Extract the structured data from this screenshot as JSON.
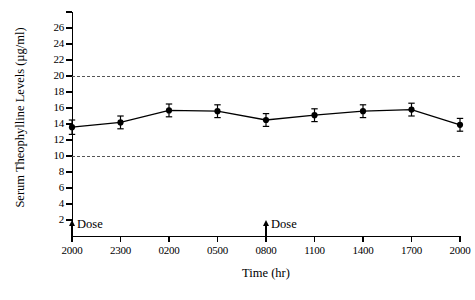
{
  "chart_data": {
    "type": "line",
    "title": "",
    "subtitle": "",
    "xlabel": "Time (hr)",
    "ylabel": "Serum Theophylline Levels (µg/ml)",
    "categories": [
      "2000",
      "2300",
      "0200",
      "0500",
      "0800",
      "1100",
      "1400",
      "1700",
      "2000"
    ],
    "values": [
      13.6,
      14.2,
      15.7,
      15.6,
      14.5,
      15.1,
      15.6,
      15.8,
      13.9
    ],
    "errors": [
      0.9,
      0.8,
      0.8,
      0.8,
      0.8,
      0.8,
      0.8,
      0.8,
      0.8
    ],
    "series": [
      {
        "name": "Serum theophylline level",
        "values": [
          13.6,
          14.2,
          15.7,
          15.6,
          14.5,
          15.1,
          15.6,
          15.8,
          13.9
        ],
        "errors": [
          0.9,
          0.8,
          0.8,
          0.8,
          0.8,
          0.8,
          0.8,
          0.8,
          0.8
        ],
        "marker": "filled-circle",
        "color": "#000000"
      }
    ],
    "ylim": [
      0,
      28
    ],
    "xlim": [
      0,
      8
    ],
    "ytick_labels": [
      "2",
      "4",
      "6",
      "8",
      "10",
      "12",
      "14",
      "16",
      "18",
      "20",
      "22",
      "24",
      "26"
    ],
    "ytick_values": [
      2,
      4,
      6,
      8,
      10,
      12,
      14,
      16,
      18,
      20,
      22,
      24,
      26
    ],
    "ytick_unlabeled": [
      28
    ],
    "xtick_labels": [
      "2000",
      "2300",
      "0200",
      "0500",
      "0800",
      "1100",
      "1400",
      "1700",
      "2000"
    ],
    "grid": false,
    "legend": "none",
    "reference_lines": [
      {
        "name": "upper-therapeutic-limit",
        "value": 20,
        "style": "dashed",
        "color": "#555555"
      },
      {
        "name": "lower-therapeutic-limit",
        "value": 10,
        "style": "dashed",
        "color": "#555555"
      }
    ],
    "annotations": [
      {
        "name": "dose-marker-1",
        "label": "Dose",
        "x_category": "2000",
        "x_index": 0,
        "y": 2.0,
        "marker": "up-arrow"
      },
      {
        "name": "dose-marker-2",
        "label": "Dose",
        "x_category": "0800",
        "x_index": 4,
        "y": 2.0,
        "marker": "up-arrow"
      }
    ]
  },
  "colors": {
    "axis": "#000000",
    "series": "#000000",
    "reference_line": "#555555",
    "background": "#ffffff"
  }
}
